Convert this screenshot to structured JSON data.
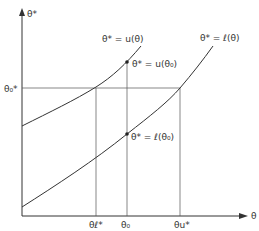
{
  "diagram": {
    "axes": {
      "y_label": "θ*",
      "x_label": "θ"
    },
    "curves": [
      {
        "name": "upper-curve",
        "label": "θ* = u(θ)"
      },
      {
        "name": "lower-curve",
        "label": "θ* = ℓ(θ)"
      }
    ],
    "points": [
      {
        "name": "point-u-theta0",
        "label": "θ* = u(θ₀)"
      },
      {
        "name": "point-l-theta0",
        "label": "θ* = ℓ(θ₀)"
      }
    ],
    "y_ticks": [
      {
        "label": "θ₀*"
      }
    ],
    "x_ticks": [
      {
        "label": "θℓ*"
      },
      {
        "label": "θ₀"
      },
      {
        "label": "θu*"
      }
    ],
    "colors": {
      "ink": "#333333",
      "background": "#ffffff"
    }
  }
}
